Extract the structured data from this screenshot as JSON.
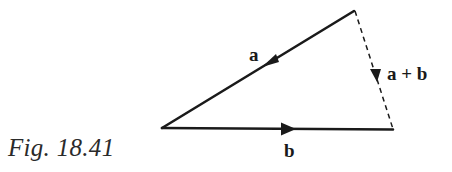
{
  "figure": {
    "caption": "Fig. 18.41",
    "colors": {
      "line": "#1a1a1a",
      "background": "#ffffff"
    },
    "vertices": {
      "top": [
        354,
        11
      ],
      "left": [
        162,
        128
      ],
      "right": [
        393,
        129
      ]
    },
    "vectors": [
      {
        "name": "a",
        "label": "a",
        "from": "top",
        "to": "left",
        "style": "solid",
        "arrow_direction": "toward-left-vertex"
      },
      {
        "name": "b",
        "label": "b",
        "from": "left",
        "to": "right",
        "style": "solid",
        "arrow_direction": "toward-right-vertex"
      },
      {
        "name": "a_plus_b",
        "label": "a + b",
        "from": "top",
        "to": "right",
        "style": "dashed",
        "arrow_direction": "downward"
      }
    ]
  }
}
